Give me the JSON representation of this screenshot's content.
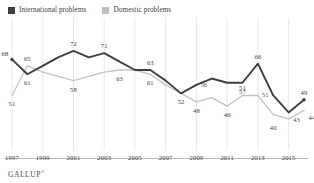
{
  "legend": {
    "position": "top-left",
    "entries": [
      {
        "label": "International problems",
        "color": "#3f3f3f",
        "swatch": "legend-swatch-international"
      },
      {
        "label": "Domestic problems",
        "color": "#bfbfbf",
        "swatch": "legend-swatch-domestic"
      }
    ]
  },
  "footer": {
    "brand": "GALLUP",
    "trademark": "®"
  },
  "chart_data": {
    "type": "line",
    "title": "",
    "subtitle": "",
    "xlabel": "",
    "ylabel": "",
    "grid": true,
    "grid_axis": "x",
    "ylim": [
      30,
      80
    ],
    "xlim": [
      1997,
      2016
    ],
    "tick_labels": [
      "1997",
      "1999",
      "2001",
      "2003",
      "2005",
      "2007",
      "2009",
      "2011",
      "2013",
      "2015"
    ],
    "x": [
      1997,
      1998,
      1999,
      2000,
      2001,
      2002,
      2003,
      2004,
      2005,
      2006,
      2007,
      2008,
      2009,
      2010,
      2011,
      2012,
      2013,
      2014,
      2015,
      2016
    ],
    "series": [
      {
        "name": "International problems",
        "color": "#3f3f3f",
        "values": [
          68,
          61,
          65,
          69,
          72,
          69,
          71,
          67,
          63,
          63,
          58,
          52,
          56,
          59,
          57,
          57,
          66,
          51,
          43,
          49
        ],
        "labels": [
          {
            "x": 1997,
            "value": 68,
            "text": "68",
            "anchor": "top-left"
          },
          {
            "x": 1998,
            "value": 61,
            "text": "61",
            "anchor": "bottom"
          },
          {
            "x": 2001,
            "value": 72,
            "text": "72",
            "anchor": "top"
          },
          {
            "x": 2003,
            "value": 71,
            "text": "71",
            "anchor": "top"
          },
          {
            "x": 2006,
            "value": 63,
            "text": "63",
            "anchor": "top"
          },
          {
            "x": 2008,
            "value": 52,
            "text": "52",
            "anchor": "bottom"
          },
          {
            "x": 2010,
            "value": 56,
            "text": "56",
            "anchor": "left"
          },
          {
            "x": 2012,
            "value": 57,
            "text": "57",
            "anchor": "bottom"
          },
          {
            "x": 2013,
            "value": 66,
            "text": "66",
            "anchor": "top"
          },
          {
            "x": 2014,
            "value": 51,
            "text": "51",
            "anchor": "left"
          },
          {
            "x": 2015,
            "value": 43,
            "text": "43",
            "anchor": "bottom-right"
          },
          {
            "x": 2016,
            "value": 49,
            "text": "49",
            "anchor": "top"
          }
        ]
      },
      {
        "name": "Domestic problems",
        "color": "#c2c2c2",
        "values": [
          51,
          65,
          62,
          60,
          58,
          60,
          62,
          63,
          63,
          61,
          56,
          52,
          48,
          50,
          46,
          51,
          51,
          42,
          40,
          44
        ],
        "labels": [
          {
            "x": 1997,
            "value": 51,
            "text": "51",
            "anchor": "bottom"
          },
          {
            "x": 1998,
            "value": 65,
            "text": "65",
            "anchor": "top"
          },
          {
            "x": 2001,
            "value": 58,
            "text": "58",
            "anchor": "bottom"
          },
          {
            "x": 2004,
            "value": 63,
            "text": "63",
            "anchor": "bottom"
          },
          {
            "x": 2006,
            "value": 61,
            "text": "61",
            "anchor": "bottom"
          },
          {
            "x": 2009,
            "value": 48,
            "text": "48",
            "anchor": "bottom"
          },
          {
            "x": 2011,
            "value": 46,
            "text": "46",
            "anchor": "bottom"
          },
          {
            "x": 2012,
            "value": 51,
            "text": "51",
            "anchor": "top"
          },
          {
            "x": 2014,
            "value": 40,
            "text": "40",
            "anchor": "bottom"
          },
          {
            "x": 2016,
            "value": 44,
            "text": "44",
            "anchor": "bottom-right"
          }
        ]
      }
    ]
  }
}
